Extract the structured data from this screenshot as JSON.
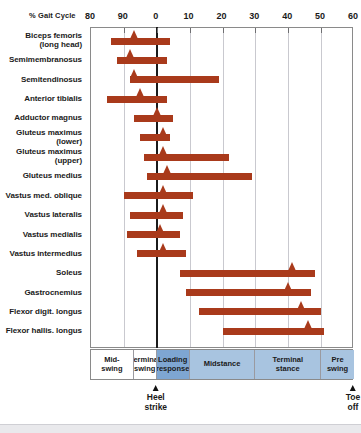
{
  "chart_data": {
    "type": "bar",
    "title": "",
    "xlabel": "% Gait Cycle",
    "ylabel": "",
    "grid": true,
    "legend": null,
    "axis_ticks": [
      {
        "label": "80",
        "value": 80
      },
      {
        "label": "90",
        "value": 90
      },
      {
        "label": "0",
        "value": 100
      },
      {
        "label": "10",
        "value": 110
      },
      {
        "label": "20",
        "value": 120
      },
      {
        "label": "30",
        "value": 130
      },
      {
        "label": "40",
        "value": 140
      },
      {
        "label": "50",
        "value": 150
      },
      {
        "label": "60",
        "value": 160
      }
    ],
    "xlim": [
      80,
      160
    ],
    "bar_color": "#a93a1b",
    "categories": [
      "Biceps femoris (long head)",
      "Semimembranosus",
      "Semitendinosus",
      "Anterior tibialis",
      "Adductor magnus",
      "Gluteus maximus (lower)",
      "Gluteus maximus (upper)",
      "Gluteus medius",
      "Vastus med. oblique",
      "Vastus lateralis",
      "Vastus medialis",
      "Vastus intermedius",
      "Soleus",
      "Gastrocnemius",
      "Flexor digit. longus",
      "Flexor hallis. longus"
    ],
    "bars": [
      {
        "muscle": "Biceps femoris (long head)",
        "start": 86,
        "end": 104,
        "peak": 93
      },
      {
        "muscle": "Semimembranosus",
        "start": 88,
        "end": 103,
        "peak": 92
      },
      {
        "muscle": "Semitendinosus",
        "start": 92,
        "end": 119,
        "peak": 93
      },
      {
        "muscle": "Anterior tibialis",
        "start": 85,
        "end": 103,
        "peak": 95
      },
      {
        "muscle": "Adductor magnus",
        "start": 93,
        "end": 105,
        "peak": 100
      },
      {
        "muscle": "Gluteus maximus (lower)",
        "start": 95,
        "end": 104,
        "peak": 102
      },
      {
        "muscle": "Gluteus maximus (upper)",
        "start": 96,
        "end": 122,
        "peak": 102
      },
      {
        "muscle": "Gluteus medius",
        "start": 97,
        "end": 129,
        "peak": 103
      },
      {
        "muscle": "Vastus med. oblique",
        "start": 90,
        "end": 111,
        "peak": 102
      },
      {
        "muscle": "Vastus lateralis",
        "start": 92,
        "end": 108,
        "peak": 102
      },
      {
        "muscle": "Vastus medialis",
        "start": 91,
        "end": 107,
        "peak": 101
      },
      {
        "muscle": "Vastus intermedius",
        "start": 94,
        "end": 109,
        "peak": 102
      },
      {
        "muscle": "Soleus",
        "start": 107,
        "end": 148,
        "peak": 141
      },
      {
        "muscle": "Gastrocnemius",
        "start": 109,
        "end": 147,
        "peak": 140
      },
      {
        "muscle": "Flexor digit. longus",
        "start": 113,
        "end": 150,
        "peak": 144
      },
      {
        "muscle": "Flexor hallis. longus",
        "start": 120,
        "end": 151,
        "peak": 146
      }
    ],
    "phases": [
      {
        "label": "Mid-swing",
        "start": 80,
        "end": 93,
        "color": "#ffffff"
      },
      {
        "label": "Terminal swing",
        "start": 93,
        "end": 100,
        "color": "#ffffff"
      },
      {
        "label": "Loading response",
        "start": 100,
        "end": 110,
        "color": "#7ea6d2"
      },
      {
        "label": "Midstance",
        "start": 110,
        "end": 130,
        "color": "#a8c4e0"
      },
      {
        "label": "Terminal stance",
        "start": 130,
        "end": 150,
        "color": "#a8c4e0"
      },
      {
        "label": "Pre-swing",
        "start": 150,
        "end": 160,
        "color": "#a8c4e0"
      }
    ],
    "events": [
      {
        "label": "Heel\nstrike",
        "line1": "Heel",
        "line2": "strike",
        "value": 100
      },
      {
        "label": "Toe\noff",
        "line1": "Toe",
        "line2": "off",
        "value": 160
      }
    ]
  },
  "chart": {
    "x_axis_caption": "% Gait Cycle"
  }
}
